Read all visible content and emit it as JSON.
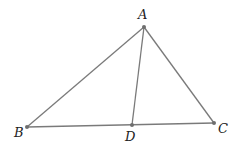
{
  "diagram": {
    "type": "geometry-triangle",
    "points": {
      "A": {
        "label": "A",
        "x": 144,
        "y": 27,
        "lx": 138,
        "ly": 19
      },
      "B": {
        "label": "B",
        "x": 27,
        "y": 127,
        "lx": 14,
        "ly": 137
      },
      "C": {
        "label": "C",
        "x": 214,
        "y": 123,
        "lx": 218,
        "ly": 133
      },
      "D": {
        "label": "D",
        "x": 132,
        "y": 125,
        "lx": 125,
        "ly": 141
      }
    },
    "segments": [
      {
        "name": "AB",
        "from": "A",
        "to": "B"
      },
      {
        "name": "AC",
        "from": "A",
        "to": "C"
      },
      {
        "name": "BC",
        "from": "B",
        "to": "C"
      },
      {
        "name": "AD",
        "from": "A",
        "to": "D"
      }
    ],
    "colors": {
      "line": "#7a7a7a",
      "point": "#6e6e6e",
      "label": "#222222"
    }
  }
}
